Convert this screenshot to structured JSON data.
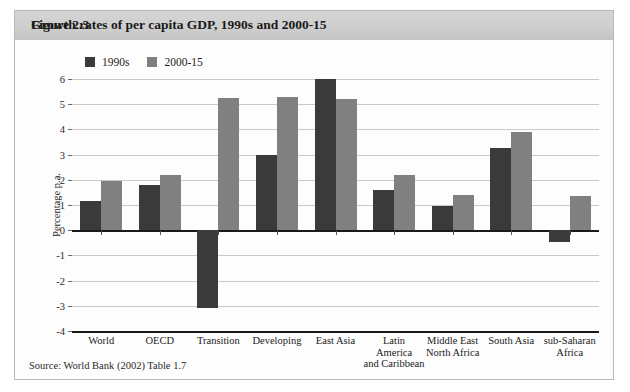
{
  "figure": {
    "number": "Figure 2.3",
    "title": "Growth rates of per capita GDP, 1990s and 2000-15",
    "source": "Source: World Bank (2002) Table 1.7"
  },
  "colors": {
    "series_1990s": "#3a3a3a",
    "series_2000_15": "#808080",
    "gridline": "#c9c9c9",
    "axis": "#1a1a1a",
    "title_band": "#cfcfcf",
    "frame_border": "#b9b9b9"
  },
  "chart_data": {
    "type": "bar",
    "title": "Growth rates of per capita GDP, 1990s and 2000-15",
    "xlabel": "",
    "ylabel": "Percentage p.a.",
    "ylim": [
      -4,
      6
    ],
    "yticks": [
      6,
      5,
      4,
      3,
      2,
      1,
      0,
      -1,
      -2,
      -3,
      -4
    ],
    "ytick_labels": [
      "6",
      "5",
      "4",
      "3",
      "2",
      "1",
      "0",
      "-1",
      "-2",
      "-3",
      "-4"
    ],
    "grid": true,
    "legend_position": "top-left",
    "categories": [
      "World",
      "OECD",
      "Transition",
      "Developing",
      "East Asia",
      "Latin\nAmerica\nand Caribbean",
      "Middle East\nNorth Africa",
      "South Asia",
      "sub-Saharan\nAfrica"
    ],
    "category_lines": [
      [
        "World"
      ],
      [
        "OECD"
      ],
      [
        "Transition"
      ],
      [
        "Developing"
      ],
      [
        "East Asia"
      ],
      [
        "Latin",
        "America",
        "and Caribbean"
      ],
      [
        "Middle East",
        "North Africa"
      ],
      [
        "South Asia"
      ],
      [
        "sub-Saharan",
        "Africa"
      ]
    ],
    "series": [
      {
        "name": "1990s",
        "color": "#3a3a3a",
        "values": [
          1.15,
          1.8,
          -3.1,
          3.0,
          6.0,
          1.6,
          0.95,
          3.25,
          -0.45
        ]
      },
      {
        "name": "2000-15",
        "color": "#808080",
        "values": [
          1.95,
          2.2,
          5.25,
          5.3,
          5.2,
          2.2,
          1.4,
          3.9,
          1.35
        ]
      }
    ]
  }
}
